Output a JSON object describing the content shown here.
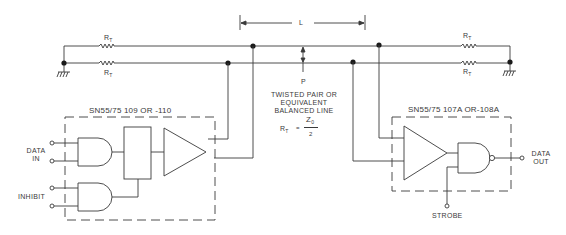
{
  "diagram": {
    "type": "circuit-schematic",
    "line": {
      "length_label": "L",
      "point_label": "P",
      "description_lines": [
        "TWISTED PAIR OR",
        "EQUIVALENT",
        "BALANCED LINE"
      ],
      "termination_formula": {
        "lhs": "R",
        "lhs_sub": "T",
        "equals": "=",
        "numerator": "Z",
        "numerator_sub": "0",
        "denominator": "2"
      }
    },
    "resistors": [
      {
        "id": "rt-left-top",
        "label": "R",
        "sub": "T"
      },
      {
        "id": "rt-left-bottom",
        "label": "R",
        "sub": "T"
      },
      {
        "id": "rt-right-top",
        "label": "R",
        "sub": "T"
      },
      {
        "id": "rt-right-bottom",
        "label": "R",
        "sub": "T"
      }
    ],
    "driver": {
      "title": "SN55/75 109 OR -110",
      "inputs": [
        {
          "label_lines": [
            "DATA",
            "IN"
          ]
        },
        {
          "label_lines": [
            "INHIBIT"
          ]
        }
      ]
    },
    "receiver": {
      "title": "SN55/75 107A OR-108A",
      "output_label_lines": [
        "DATA",
        "OUT"
      ],
      "strobe_label": "STROBE"
    },
    "colors": {
      "ink": "#3a3a3a",
      "background": "#ffffff"
    }
  }
}
